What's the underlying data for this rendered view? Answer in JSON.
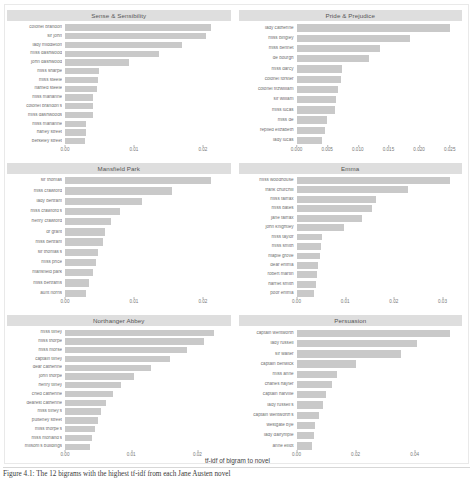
{
  "figure": {
    "axis_title": "tf-idf of bigram to novel",
    "caption": "Figure 4.1: The 12 bigrams with the highest tf-idf from each Jane Austen novel"
  },
  "chart_data": {
    "type": "bar",
    "title": "",
    "xlabel": "tf-idf of bigram to novel",
    "ylabel": "",
    "orientation": "horizontal",
    "grid": false,
    "legend": "none",
    "bar_color": "#c9c9c9",
    "strip_color": "#dedede",
    "facets": [
      {
        "name": "Sense & Sensibility",
        "xlim": [
          0,
          0.024
        ],
        "ticks": [
          "0.00",
          "0.01",
          "0.02"
        ],
        "tick_values": [
          0.0,
          0.01,
          0.02
        ],
        "categories": [
          "colonel brandon",
          "sir john",
          "lady middleton",
          "miss dashwood",
          "john dashwood",
          "miss sharpe",
          "miss steele",
          "named steele",
          "miss marianne",
          "colonel brandon's",
          "miss dashwoods",
          "miss marianne",
          "harley street",
          "berkeley street"
        ],
        "values": [
          0.0212,
          0.0205,
          0.017,
          0.0137,
          0.0093,
          0.005,
          0.0048,
          0.0047,
          0.0041,
          0.0041,
          0.004,
          0.0031,
          0.003,
          0.0029
        ]
      },
      {
        "name": "Pride & Prejudice",
        "xlim": [
          0,
          0.027
        ],
        "ticks": [
          "0.000",
          "0.005",
          "0.010",
          "0.015",
          "0.020",
          "0.025"
        ],
        "tick_values": [
          0.0,
          0.005,
          0.01,
          0.015,
          0.02,
          0.025
        ],
        "categories": [
          "lady catherine",
          "miss bingley",
          "miss bennet",
          "de bourgh",
          "miss darcy",
          "colonel forster",
          "colonel fitzwilliam",
          "sir william",
          "miss lucas",
          "miss de",
          "replied elizabeth",
          "lady lucas"
        ],
        "values": [
          0.025,
          0.0185,
          0.0137,
          0.0118,
          0.0075,
          0.0072,
          0.0068,
          0.0065,
          0.0062,
          0.005,
          0.0046,
          0.0041
        ]
      },
      {
        "name": "Mansfield Park",
        "xlim": [
          0,
          0.024
        ],
        "ticks": [
          "0.00",
          "0.01",
          "0.02"
        ],
        "tick_values": [
          0.0,
          0.01,
          0.02
        ],
        "categories": [
          "sir thomas",
          "miss crawford",
          "lady bertram",
          "miss crawford's",
          "henry crawford",
          "dr grant",
          "miss bertram",
          "sir thomas's",
          "miss price",
          "mansfield park",
          "miss bertrams",
          "aunt norris"
        ],
        "values": [
          0.0212,
          0.0155,
          0.0112,
          0.008,
          0.0067,
          0.0058,
          0.0055,
          0.0048,
          0.0045,
          0.004,
          0.0035,
          0.0031
        ]
      },
      {
        "name": "Emma",
        "xlim": [
          0,
          0.034
        ],
        "ticks": [
          "0.00",
          "0.01",
          "0.02",
          "0.03"
        ],
        "tick_values": [
          0.0,
          0.01,
          0.02,
          0.03
        ],
        "categories": [
          "miss woodhouse",
          "frank churchill",
          "miss fairfax",
          "miss bates",
          "jane fairfax",
          "john knightley",
          "miss taylor",
          "miss smith",
          "maple grove",
          "dear emma",
          "robert martin",
          "harriet smith",
          "poor emma"
        ],
        "values": [
          0.0315,
          0.023,
          0.0163,
          0.0155,
          0.0134,
          0.0097,
          0.0053,
          0.005,
          0.0048,
          0.0045,
          0.0042,
          0.004,
          0.0036
        ]
      },
      {
        "name": "Northanger Abbey",
        "xlim": [
          0,
          0.025
        ],
        "ticks": [
          "0.00",
          "0.01",
          "0.02"
        ],
        "tick_values": [
          0.0,
          0.01,
          0.02
        ],
        "categories": [
          "miss tilney",
          "miss thorpe",
          "miss morse",
          "captain tilney",
          "dear catherine",
          "john thorpe",
          "henry tilney",
          "cried catherine",
          "dearest catherine",
          "miss tilney's",
          "pulteney street",
          "miss thorpe's",
          "miss morland's",
          "milsom's buildings"
        ],
        "values": [
          0.0225,
          0.021,
          0.0185,
          0.0158,
          0.013,
          0.0104,
          0.0084,
          0.0072,
          0.0062,
          0.0055,
          0.005,
          0.0046,
          0.0041,
          0.0038
        ]
      },
      {
        "name": "Persuasion",
        "xlim": [
          0,
          0.056
        ],
        "ticks": [
          "0.00",
          "0.02",
          "0.04"
        ],
        "tick_values": [
          0.0,
          0.02,
          0.04
        ],
        "categories": [
          "captain wentworth",
          "lady russell",
          "sir walter",
          "captain benwick",
          "miss anne",
          "charles hayter",
          "captain harville",
          "lady russell's",
          "captain wentworth's",
          "westgate bye",
          "lady dalrymple",
          "anne elliot"
        ],
        "values": [
          0.052,
          0.0408,
          0.0352,
          0.0203,
          0.0138,
          0.012,
          0.01,
          0.0088,
          0.0076,
          0.0064,
          0.0058,
          0.0052
        ]
      }
    ]
  }
}
